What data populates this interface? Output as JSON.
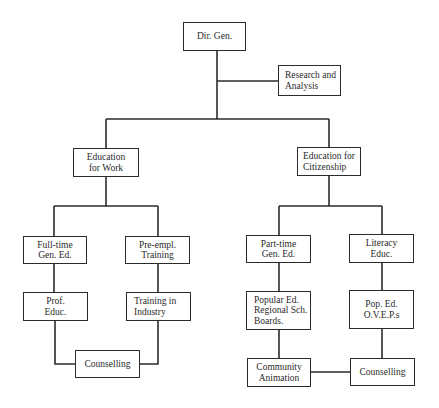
{
  "diagram": {
    "type": "organizational-chart",
    "nodes": {
      "dir_gen": {
        "lines": [
          "Dir. Gen."
        ]
      },
      "research": {
        "lines": [
          "Research and",
          "Analysis"
        ]
      },
      "edu_work": {
        "lines": [
          "Education",
          "for Work"
        ]
      },
      "edu_citizen": {
        "lines": [
          "Education for",
          "Citizenship"
        ]
      },
      "fulltime": {
        "lines": [
          "Full-time",
          "Gen. Ed."
        ]
      },
      "preempl": {
        "lines": [
          "Pre-empl.",
          "Training"
        ]
      },
      "prof_educ": {
        "lines": [
          "Prof.",
          "Educ."
        ]
      },
      "training_industry": {
        "lines": [
          "Training in",
          "Industry"
        ]
      },
      "counselling_work": {
        "lines": [
          "Counselling"
        ]
      },
      "parttime": {
        "lines": [
          "Part-time",
          "Gen. Ed."
        ]
      },
      "literacy": {
        "lines": [
          "Literacy",
          "Educ."
        ]
      },
      "popular_ed": {
        "lines": [
          "Popular Ed.",
          "Regional Sch.",
          "Boards."
        ]
      },
      "pop_ed_oveps": {
        "lines": [
          "Pop. Ed.",
          "O.V.E.P.s"
        ]
      },
      "community_animation": {
        "lines": [
          "Community",
          "Animation"
        ]
      },
      "counselling_citizen": {
        "lines": [
          "Counselling"
        ]
      }
    },
    "edges": [
      [
        "Dir. Gen.",
        "Research and Analysis"
      ],
      [
        "Dir. Gen.",
        "Education for Work"
      ],
      [
        "Dir. Gen.",
        "Education for Citizenship"
      ],
      [
        "Education for Work",
        "Full-time Gen. Ed."
      ],
      [
        "Education for Work",
        "Pre-empl. Training"
      ],
      [
        "Full-time Gen. Ed.",
        "Prof. Educ."
      ],
      [
        "Pre-empl. Training",
        "Training in Industry"
      ],
      [
        "Prof. Educ.",
        "Counselling"
      ],
      [
        "Training in Industry",
        "Counselling"
      ],
      [
        "Education for Citizenship",
        "Part-time Gen. Ed."
      ],
      [
        "Education for Citizenship",
        "Literacy Educ."
      ],
      [
        "Part-time Gen. Ed.",
        "Popular Ed. Regional Sch. Boards."
      ],
      [
        "Literacy Educ.",
        "Pop. Ed. O.V.E.P.s"
      ],
      [
        "Popular Ed. Regional Sch. Boards.",
        "Community Animation"
      ],
      [
        "Pop. Ed. O.V.E.P.s",
        "Counselling"
      ],
      [
        "Community Animation",
        "Counselling"
      ]
    ]
  }
}
